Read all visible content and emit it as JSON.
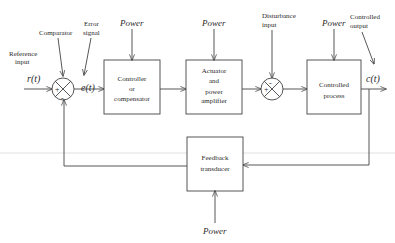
{
  "diagram": {
    "labels": {
      "reference_input": [
        "Reference",
        "input"
      ],
      "comparator": "Comparator",
      "error_signal": [
        "Error",
        "signal"
      ],
      "disturbance_input": [
        "Disturbance",
        "input"
      ],
      "controlled_output": [
        "Controlled",
        "output"
      ]
    },
    "signals": {
      "reference": "r(t)",
      "error": "e(t)",
      "output": "c(t)"
    },
    "power_label": "Power",
    "blocks": {
      "controller": [
        "Controller",
        "or",
        "compensator"
      ],
      "actuator": [
        "Actuator",
        "and",
        "power",
        "amplifier"
      ],
      "process": [
        "Controlled",
        "process"
      ],
      "feedback": [
        "Feedback",
        "transducer"
      ]
    },
    "junctions": {
      "comparator": {
        "plus": "+",
        "minus": "-"
      },
      "disturbance": {
        "plus": "+",
        "minus": "-"
      }
    },
    "colors": {
      "line": "#444444",
      "text": "#2a2a2a",
      "background": "#ffffff"
    }
  }
}
